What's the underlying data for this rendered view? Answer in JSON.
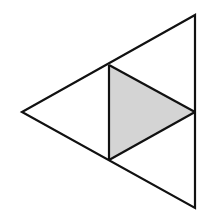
{
  "diagram": {
    "colors": {
      "stroke": "#111111",
      "shade": "#d4d4d4",
      "background": "#ffffff"
    },
    "vertices": {
      "outer_top": [
        195,
        15
      ],
      "outer_left": [
        22,
        112
      ],
      "outer_bottom": [
        195,
        208
      ],
      "mid_top": [
        109,
        65
      ],
      "mid_right": [
        195,
        112
      ],
      "mid_bottom": [
        109,
        160
      ]
    },
    "regions": [
      {
        "name": "top-triangle",
        "shaded": false
      },
      {
        "name": "left-triangle",
        "shaded": false
      },
      {
        "name": "bottom-triangle",
        "shaded": false
      },
      {
        "name": "center-triangle",
        "shaded": true
      }
    ]
  }
}
